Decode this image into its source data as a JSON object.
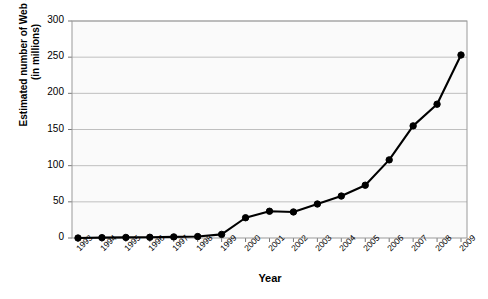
{
  "chart_data": {
    "type": "line",
    "title": "",
    "xlabel": "Year",
    "ylabel": "Estimated number of Web sites (in millions)",
    "ylabel_line1": "Estimated number of Web sites",
    "ylabel_line2": "(in millions)",
    "categories": [
      "1993",
      "1994",
      "1995",
      "1996",
      "1997",
      "1998",
      "1999",
      "2000",
      "2001",
      "2002",
      "2003",
      "2004",
      "2005",
      "2006",
      "2007",
      "2008",
      "2009"
    ],
    "values": [
      0,
      0.5,
      0.8,
      1,
      1.5,
      2,
      5,
      28,
      37,
      36,
      47,
      58,
      73,
      108,
      155,
      185,
      253
    ],
    "ylim": [
      0,
      300
    ],
    "yticks": [
      0,
      50,
      100,
      150,
      200,
      250,
      300
    ],
    "ytick_labels": [
      "0",
      "50",
      "100",
      "150",
      "200",
      "250",
      "300"
    ],
    "grid": true,
    "grid_axis": "y",
    "legend": null,
    "marker": "filled-circle",
    "line_color": "#000000",
    "marker_color": "#000000",
    "grid_color": "#bfbfbf",
    "axis_color": "#808080",
    "plot_background": "#fafafa",
    "xtick_rotation": -45
  },
  "figure": {
    "width": 488,
    "height": 299,
    "background": "#ffffff"
  },
  "bleed_text": [
    "a growing number of people are turning to the web for",
    "information and the number of sites continues to climb",
    "steadily each year as shown by the data",
    "in the accompanying figure below which",
    "illustrates the estimated total count",
    "of active registered web sites worldwide",
    "from the early years through the present decade",
    "analysts expect this trend to continue",
    "over the coming period of expansion"
  ]
}
